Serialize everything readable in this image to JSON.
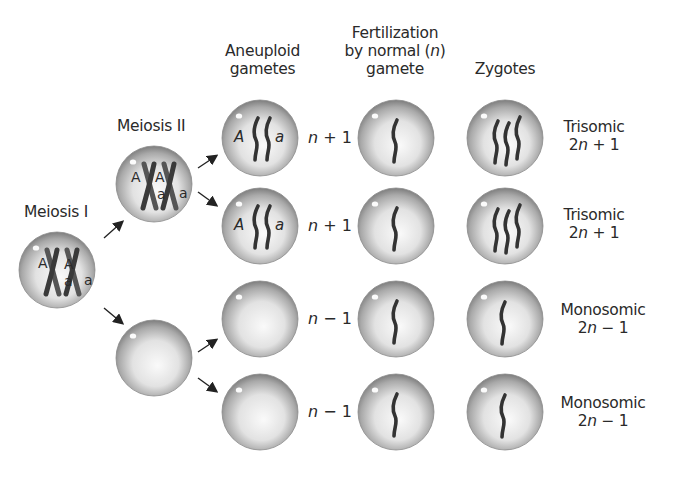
{
  "headers": {
    "aneuploid_line1": "Aneuploid",
    "aneuploid_line2": "gametes",
    "fert_line1": "Fertilization",
    "fert_line2_pre": "by normal (",
    "fert_line2_n": "n",
    "fert_line2_post": ")",
    "fert_line3": "gamete",
    "zygotes": "Zygotes"
  },
  "stages": {
    "meiosis1": "Meiosis I",
    "meiosis2": "Meiosis II"
  },
  "alleles": {
    "upper": "A",
    "lower": "a"
  },
  "gametes": [
    {
      "n": "n",
      "op": "+",
      "k": "1",
      "alleles": [
        "A",
        "a"
      ]
    },
    {
      "n": "n",
      "op": "+",
      "k": "1",
      "alleles": [
        "A",
        "a"
      ]
    },
    {
      "n": "n",
      "op": "−",
      "k": "1",
      "alleles": []
    },
    {
      "n": "n",
      "op": "−",
      "k": "1",
      "alleles": []
    }
  ],
  "zygotes": [
    {
      "type": "Trisomic",
      "pre": "2",
      "n": "n",
      "suffix": " + 1"
    },
    {
      "type": "Trisomic",
      "pre": "2",
      "n": "n",
      "suffix": " + 1"
    },
    {
      "type": "Monosomic",
      "pre": "2",
      "n": "n",
      "suffix": " − 1"
    },
    {
      "type": "Monosomic",
      "pre": "2",
      "n": "n",
      "suffix": " − 1"
    }
  ],
  "colors": {
    "chromosome": "#3a3a3a",
    "cell_edge": "#7a7a7a",
    "cell_center": "#f4f4f4",
    "arrow": "#222222",
    "text": "#2a2a2a"
  }
}
